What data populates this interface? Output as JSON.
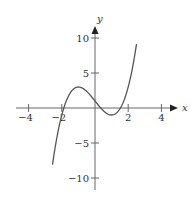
{
  "chart_data": {
    "type": "line",
    "title": "",
    "xlabel": "x",
    "ylabel": "y",
    "xlim": [
      -4.5,
      4.8
    ],
    "ylim": [
      -12,
      11.5
    ],
    "x_ticks": [
      -4,
      -2,
      2,
      4
    ],
    "x_tick_labels": [
      "−4",
      "−2",
      "2",
      "4"
    ],
    "y_ticks": [
      10,
      5,
      -5,
      -10
    ],
    "y_tick_labels": [
      "10",
      "5",
      "−5",
      "−10"
    ],
    "grid": false,
    "legend": null,
    "series": [
      {
        "name": "f(x) = x^3 - 3x + 1",
        "x_range": [
          -2.56,
          2.5
        ],
        "x": [
          -2.56,
          -2.25,
          -2.0,
          -1.88,
          -1.5,
          -1.0,
          -0.5,
          0.0,
          0.35,
          0.5,
          1.0,
          1.53,
          2.0,
          2.25,
          2.5
        ],
        "values": [
          -8.1,
          -3.64,
          -1.0,
          0.0,
          2.13,
          3.0,
          2.38,
          1.0,
          0.0,
          -0.38,
          -1.0,
          0.0,
          3.0,
          5.64,
          9.13
        ]
      }
    ],
    "features": {
      "local_max": [
        -1,
        3
      ],
      "local_min": [
        1,
        -1
      ],
      "roots": [
        -1.88,
        0.35,
        1.53
      ]
    }
  },
  "axes": {
    "x_label": "x",
    "y_label": "y",
    "colors": {
      "axis": "#555555",
      "curve": "#555555"
    }
  }
}
